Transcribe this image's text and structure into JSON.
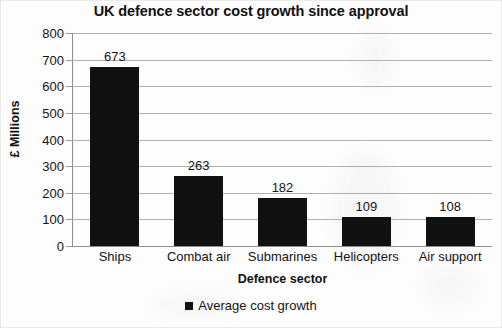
{
  "chart_data": {
    "type": "bar",
    "title": "UK defence sector cost growth since approval",
    "xlabel": "Defence sector",
    "ylabel": "£ Millions",
    "categories": [
      "Ships",
      "Combat air",
      "Submarines",
      "Helicopters",
      "Air support"
    ],
    "values": [
      673,
      263,
      182,
      109,
      108
    ],
    "series": [
      {
        "name": "Average cost growth",
        "values": [
          673,
          263,
          182,
          109,
          108
        ]
      }
    ],
    "ylim": [
      0,
      800
    ],
    "ytick_labels": [
      "800",
      "700",
      "600",
      "500",
      "400",
      "300",
      "200",
      "100",
      "0"
    ],
    "yticks": [
      800,
      700,
      600,
      500,
      400,
      300,
      200,
      100,
      0
    ],
    "grid": true,
    "legend_position": "bottom",
    "legend_entries": [
      "Average cost growth"
    ],
    "bar_color": "#111111",
    "gridline_color": "#b0b0b0",
    "background_color": "#fdfdfd",
    "data_labels": [
      "673",
      "263",
      "182",
      "109",
      "108"
    ]
  }
}
